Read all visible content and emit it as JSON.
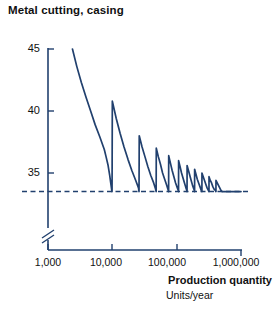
{
  "title": "Metal cutting, casing",
  "chart_data": {
    "type": "line",
    "title": "Metal cutting, casing",
    "xlabel": "Production quantity",
    "xlabel_sub": "Units/year",
    "ylabel": "",
    "xscale": "log",
    "xlim": [
      1000,
      1000000
    ],
    "ylim": [
      33.0,
      45.5
    ],
    "grid": false,
    "legend": null,
    "axis_break_y": true,
    "line_color": "#21406e",
    "asymptote": {
      "value": 33.5,
      "style": "dashed",
      "label": ""
    },
    "xticks": [
      1000,
      10000,
      100000,
      1000000
    ],
    "xtick_labels": [
      "1,000",
      "10,000",
      "100,000",
      "1,000,000"
    ],
    "yticks": [
      35,
      40,
      45
    ],
    "ytick_labels": [
      "35",
      "40",
      "45"
    ],
    "series": [
      {
        "name": "Unit cost",
        "points": [
          [
            2400,
            45.0
          ],
          [
            2800,
            43.6
          ],
          [
            3300,
            42.3
          ],
          [
            3900,
            41.1
          ],
          [
            4600,
            40.0
          ],
          [
            5400,
            38.9
          ],
          [
            6400,
            37.9
          ],
          [
            7500,
            36.9
          ],
          [
            8000,
            36.3
          ],
          [
            8600,
            35.6
          ],
          [
            9100,
            34.8
          ],
          [
            9500,
            34.1
          ],
          [
            9800,
            33.6
          ],
          [
            9900,
            33.5
          ],
          [
            10000,
            40.8
          ],
          [
            11500,
            39.4
          ],
          [
            13200,
            38.2
          ],
          [
            15200,
            37.1
          ],
          [
            17500,
            36.1
          ],
          [
            20100,
            35.2
          ],
          [
            23100,
            34.4
          ],
          [
            25500,
            33.8
          ],
          [
            26000,
            33.5
          ],
          [
            26200,
            38.0
          ],
          [
            29000,
            37.1
          ],
          [
            32200,
            36.3
          ],
          [
            35700,
            35.5
          ],
          [
            39600,
            34.8
          ],
          [
            43900,
            34.2
          ],
          [
            47000,
            33.7
          ],
          [
            48000,
            33.5
          ],
          [
            48200,
            37.0
          ],
          [
            52000,
            36.3
          ],
          [
            56000,
            35.7
          ],
          [
            60400,
            35.0
          ],
          [
            65100,
            34.5
          ],
          [
            70200,
            34.0
          ],
          [
            74000,
            33.6
          ],
          [
            75000,
            33.5
          ],
          [
            75200,
            36.4
          ],
          [
            80000,
            35.8
          ],
          [
            85100,
            35.2
          ],
          [
            90500,
            34.7
          ],
          [
            96300,
            34.2
          ],
          [
            102400,
            33.8
          ],
          [
            106000,
            33.6
          ],
          [
            107000,
            33.5
          ],
          [
            107200,
            36.0
          ],
          [
            113000,
            35.5
          ],
          [
            119100,
            35.0
          ],
          [
            125500,
            34.6
          ],
          [
            132300,
            34.2
          ],
          [
            139400,
            33.8
          ],
          [
            144000,
            33.6
          ],
          [
            145000,
            33.5
          ],
          [
            145200,
            35.6
          ],
          [
            152500,
            35.2
          ],
          [
            160100,
            34.8
          ],
          [
            168100,
            34.4
          ],
          [
            176500,
            34.0
          ],
          [
            185300,
            33.7
          ],
          [
            190000,
            33.5
          ],
          [
            190200,
            35.3
          ],
          [
            199500,
            34.9
          ],
          [
            209200,
            34.5
          ],
          [
            219400,
            34.2
          ],
          [
            230100,
            33.9
          ],
          [
            241300,
            33.6
          ],
          [
            247000,
            33.5
          ],
          [
            247200,
            35.0
          ],
          [
            258800,
            34.7
          ],
          [
            271000,
            34.4
          ],
          [
            283700,
            34.1
          ],
          [
            297000,
            33.8
          ],
          [
            311000,
            33.6
          ],
          [
            318000,
            33.5
          ],
          [
            318200,
            34.7
          ],
          [
            333000,
            34.4
          ],
          [
            348500,
            34.2
          ],
          [
            364700,
            33.9
          ],
          [
            381600,
            33.7
          ],
          [
            399200,
            33.6
          ],
          [
            408000,
            33.5
          ],
          [
            408200,
            34.4
          ],
          [
            427000,
            34.2
          ],
          [
            446600,
            34.0
          ],
          [
            467000,
            33.8
          ],
          [
            488200,
            33.6
          ],
          [
            510200,
            33.5
          ],
          [
            520000,
            33.5
          ],
          [
            560000,
            33.5
          ],
          [
            620000,
            33.5
          ],
          [
            700000,
            33.5
          ],
          [
            800000,
            33.5
          ],
          [
            900000,
            33.5
          ],
          [
            1000000,
            33.5
          ]
        ]
      }
    ]
  }
}
